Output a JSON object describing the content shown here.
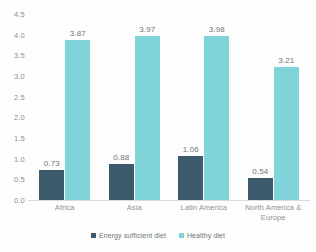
{
  "chart_data": {
    "type": "bar",
    "title": "",
    "subtitle": "",
    "xlabel": "",
    "ylabel": "",
    "ylim": [
      0.0,
      4.5
    ],
    "ytick_step": 0.5,
    "ytick_labels": [
      "4.5",
      "4.0",
      "3.5",
      "3.0",
      "2.5",
      "2.0",
      "1.5",
      "1.0",
      "0.5",
      "0.0"
    ],
    "grid": false,
    "legend_position": "bottom-center",
    "categories": [
      "Africa",
      "Asia",
      "Latin America",
      "North America & Europe"
    ],
    "category_lines": [
      [
        "Africa"
      ],
      [
        "Asia"
      ],
      [
        "Latin America"
      ],
      [
        "North America &",
        "Europe"
      ]
    ],
    "series": [
      {
        "name": "Energy sufficient diet",
        "color": "#3d5a6c",
        "values": [
          0.73,
          0.88,
          1.06,
          0.54
        ],
        "labels": [
          "0.73",
          "0.88",
          "1.06",
          "0.54"
        ]
      },
      {
        "name": "Healthy diet",
        "color": "#7ed4d8",
        "values": [
          3.87,
          3.97,
          3.98,
          3.21
        ],
        "labels": [
          "3.87",
          "3.97",
          "3.98",
          "3.21"
        ]
      }
    ]
  },
  "colors": {
    "series_energy_sufficient": "#3d5a6c",
    "series_healthy": "#7ed4d8",
    "axis_text": "#8d9196",
    "label_text": "#6f7479",
    "baseline": "#d9dcdf",
    "background": "#fdfdfd"
  }
}
